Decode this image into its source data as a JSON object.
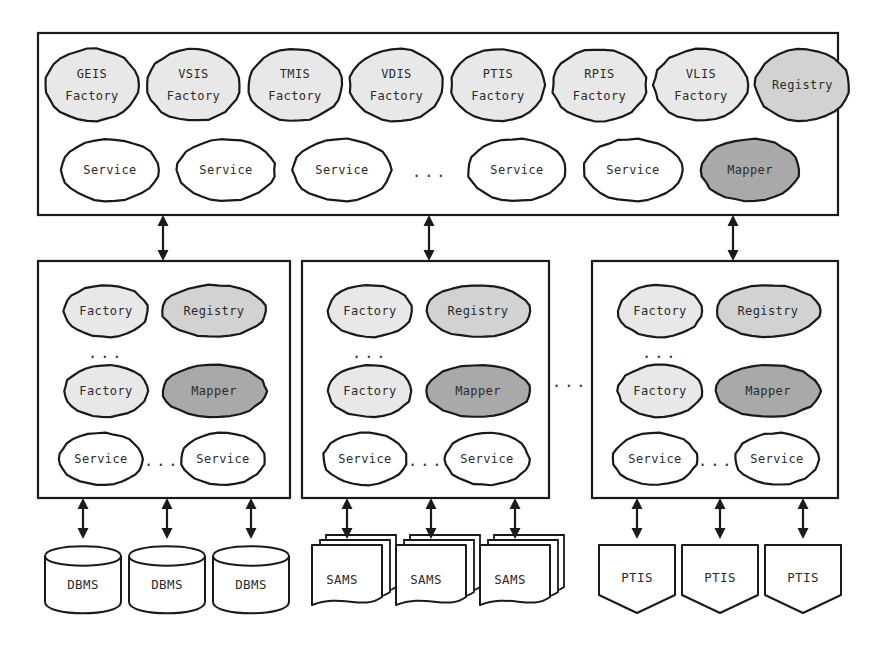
{
  "diagram": {
    "colors": {
      "outline": "#1a1a1a",
      "white": "#ffffff",
      "factory_fill": "#e8e8e8",
      "registry_fill": "#d2d2d2",
      "mapper_fill": "#a9a9a9",
      "text": "#2b2b2b"
    },
    "ellipsis_label": "..."
  },
  "top_layer": {
    "name": "global-service-layer",
    "factories": [
      {
        "line1": "GEIS",
        "line2": "Factory",
        "fill": "factory"
      },
      {
        "line1": "VSIS",
        "line2": "Factory",
        "fill": "factory"
      },
      {
        "line1": "TMIS",
        "line2": "Factory",
        "fill": "factory"
      },
      {
        "line1": "VDIS",
        "line2": "Factory",
        "fill": "factory"
      },
      {
        "line1": "PTIS",
        "line2": "Factory",
        "fill": "factory"
      },
      {
        "line1": "RPIS",
        "line2": "Factory",
        "fill": "factory"
      },
      {
        "line1": "VLIS",
        "line2": "Factory",
        "fill": "factory"
      },
      {
        "line1": "Registry",
        "line2": "",
        "fill": "registry"
      }
    ],
    "services": [
      {
        "label": "Service",
        "fill": "white"
      },
      {
        "label": "Service",
        "fill": "white"
      },
      {
        "label": "Service",
        "fill": "white"
      },
      {
        "label": "...",
        "fill": "ellipsis"
      },
      {
        "label": "Service",
        "fill": "white"
      },
      {
        "label": "Service",
        "fill": "white"
      },
      {
        "label": "Mapper",
        "fill": "mapper"
      }
    ]
  },
  "middle_layer": {
    "name": "local-wrapper-layer",
    "between_boxes_ellipsis": "...",
    "boxes": [
      {
        "name": "wrapper-dbms",
        "row1": [
          {
            "label": "Factory",
            "fill": "factory"
          },
          {
            "label": "Registry",
            "fill": "registry"
          }
        ],
        "row_ellipsis": "...",
        "row2": [
          {
            "label": "Factory",
            "fill": "factory"
          },
          {
            "label": "Mapper",
            "fill": "mapper"
          }
        ],
        "row3": [
          {
            "label": "Service",
            "fill": "white"
          },
          {
            "label": "...",
            "fill": "ellipsis"
          },
          {
            "label": "Service",
            "fill": "white"
          }
        ]
      },
      {
        "name": "wrapper-sams",
        "row1": [
          {
            "label": "Factory",
            "fill": "factory"
          },
          {
            "label": "Registry",
            "fill": "registry"
          }
        ],
        "row_ellipsis": "...",
        "row2": [
          {
            "label": "Factory",
            "fill": "factory"
          },
          {
            "label": "Mapper",
            "fill": "mapper"
          }
        ],
        "row3": [
          {
            "label": "Service",
            "fill": "white"
          },
          {
            "label": "...",
            "fill": "ellipsis"
          },
          {
            "label": "Service",
            "fill": "white"
          }
        ]
      },
      {
        "name": "wrapper-ptis",
        "row1": [
          {
            "label": "Factory",
            "fill": "factory"
          },
          {
            "label": "Registry",
            "fill": "registry"
          }
        ],
        "row_ellipsis": "...",
        "row2": [
          {
            "label": "Factory",
            "fill": "factory"
          },
          {
            "label": "Mapper",
            "fill": "mapper"
          }
        ],
        "row3": [
          {
            "label": "Service",
            "fill": "white"
          },
          {
            "label": "...",
            "fill": "ellipsis"
          },
          {
            "label": "Service",
            "fill": "white"
          }
        ]
      }
    ]
  },
  "bottom_layer": {
    "name": "data-source-layer",
    "groups": [
      {
        "name": "dbms-group",
        "shape": "cylinder",
        "items": [
          {
            "label": "DBMS"
          },
          {
            "label": "DBMS"
          },
          {
            "label": "DBMS"
          }
        ]
      },
      {
        "name": "sams-group",
        "shape": "document-stack",
        "items": [
          {
            "label": "SAMS"
          },
          {
            "label": "SAMS"
          },
          {
            "label": "SAMS"
          }
        ]
      },
      {
        "name": "ptis-group",
        "shape": "pentagon",
        "items": [
          {
            "label": "PTIS"
          },
          {
            "label": "PTIS"
          },
          {
            "label": "PTIS"
          }
        ]
      }
    ]
  }
}
